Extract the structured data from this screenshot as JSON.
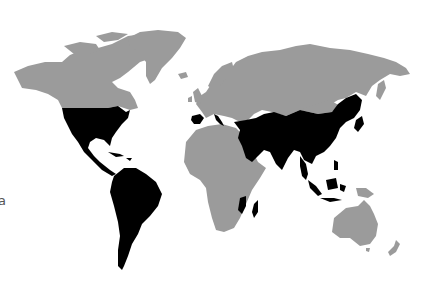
{
  "edge_text": "a",
  "map": {
    "type": "world-choropleth",
    "colors": {
      "background": "#ffffff",
      "default_land": "#9b9b9b",
      "highlighted": "#000000"
    },
    "highlighted_regions": [
      "United States",
      "Mexico",
      "Central America",
      "Caribbean",
      "South America",
      "Spain",
      "Portugal",
      "Italy",
      "Turkey",
      "Middle East",
      "Arabian Peninsula",
      "Iran",
      "Central Asia",
      "South Asia",
      "China",
      "Korea",
      "Japan",
      "Southeast Asia",
      "Indonesia",
      "Philippines",
      "Mozambique",
      "Madagascar"
    ],
    "gray_regions": [
      "Canada",
      "Alaska",
      "Greenland",
      "Europe",
      "Russia",
      "Mongolia",
      "Africa",
      "Australia",
      "New Zealand",
      "Papua New Guinea"
    ]
  }
}
